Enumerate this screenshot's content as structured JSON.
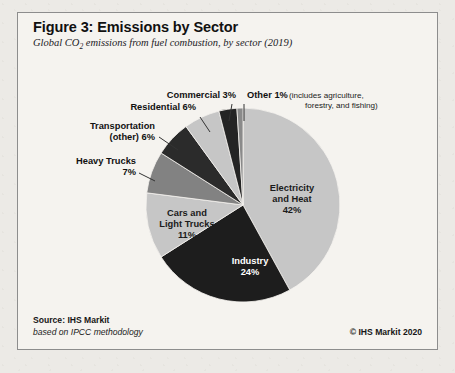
{
  "figure": {
    "title": "Figure 3: Emissions by Sector",
    "subtitle_pre": "Global CO",
    "subtitle_sub": "2",
    "subtitle_post": " emissions from fuel combustion, by sector (2019)",
    "source": "Source: IHS Markit",
    "methodology": "based on IPCC methodology",
    "copyright": "© IHS Markit 2020"
  },
  "chart_data": {
    "type": "pie",
    "title": "Figure 3: Emissions by Sector",
    "subtitle": "Global CO2 emissions from fuel combustion, by sector (2019)",
    "unit": "percent",
    "total": 100,
    "start_angle_deg": 0,
    "direction": "clockwise",
    "categories": [
      "Electricity and Heat",
      "Industry",
      "Cars and Light Trucks",
      "Heavy Trucks",
      "Transportation (other)",
      "Residential",
      "Commercial",
      "Other"
    ],
    "values": [
      42,
      24,
      11,
      7,
      6,
      6,
      3,
      1
    ],
    "colors": [
      "#c6c6c6",
      "#1d1d1d",
      "#c6c6c6",
      "#828282",
      "#2b2b2b",
      "#c6c6c6",
      "#242424",
      "#8a8a8a"
    ],
    "slices": [
      {
        "name": "Electricity and Heat",
        "value": 42,
        "color": "#c6c6c6",
        "label_lines": [
          "Electricity",
          "and Heat",
          "42%"
        ],
        "label_placement": "inside",
        "label_color": "dark",
        "label_x": 274,
        "label_y": 178
      },
      {
        "name": "Industry",
        "value": 24,
        "color": "#1d1d1d",
        "label_lines": [
          "Industry",
          "24%"
        ],
        "label_placement": "inside",
        "label_color": "light",
        "label_x": 232,
        "label_y": 251
      },
      {
        "name": "Cars and Light Trucks",
        "value": 11,
        "color": "#c6c6c6",
        "label_lines": [
          "Cars and",
          "Light Trucks",
          "11%"
        ],
        "label_placement": "inside",
        "label_color": "dark",
        "label_x": 169,
        "label_y": 203
      },
      {
        "name": "Heavy Trucks",
        "value": 7,
        "color": "#828282",
        "label_lines": [
          "Heavy Trucks",
          "7%"
        ],
        "label_placement": "outside",
        "label_anchor": "end",
        "label_x": 118,
        "label_y": 151,
        "leader": "M121,160 L137,168"
      },
      {
        "name": "Transportation (other)",
        "value": 6,
        "color": "#2b2b2b",
        "label_lines": [
          "Transportation",
          "(other) 6%"
        ],
        "label_placement": "outside",
        "label_anchor": "end",
        "label_x": 137,
        "label_y": 116,
        "leader": "M141,124 L160,137"
      },
      {
        "name": "Residential",
        "value": 6,
        "color": "#c6c6c6",
        "label_lines": [
          "Residential 6%"
        ],
        "label_placement": "outside",
        "label_anchor": "end",
        "label_x": 178,
        "label_y": 97,
        "leader": "M182,104 L192,119"
      },
      {
        "name": "Commercial",
        "value": 3,
        "color": "#242424",
        "label_lines": [
          "Commercial 3%"
        ],
        "label_placement": "outside",
        "label_anchor": "end",
        "label_x": 218,
        "label_y": 85,
        "leader": "M214,91 L211,108"
      },
      {
        "name": "Other",
        "value": 1,
        "color": "#8a8a8a",
        "label_lines": [
          "Other 1%"
        ],
        "label_placement": "outside",
        "label_anchor": "start",
        "label_x": 229,
        "label_y": 85,
        "note_lines": [
          "(includes agriculture,",
          "forestry, and fishing)"
        ],
        "note_x": 271,
        "note_y": 85,
        "note_x2": 287,
        "note_y2": 95,
        "leader": "M226,91 L226,108"
      }
    ],
    "geometry": {
      "cx": 225,
      "cy": 192,
      "r": 97
    },
    "legend": "none",
    "grid": false
  }
}
